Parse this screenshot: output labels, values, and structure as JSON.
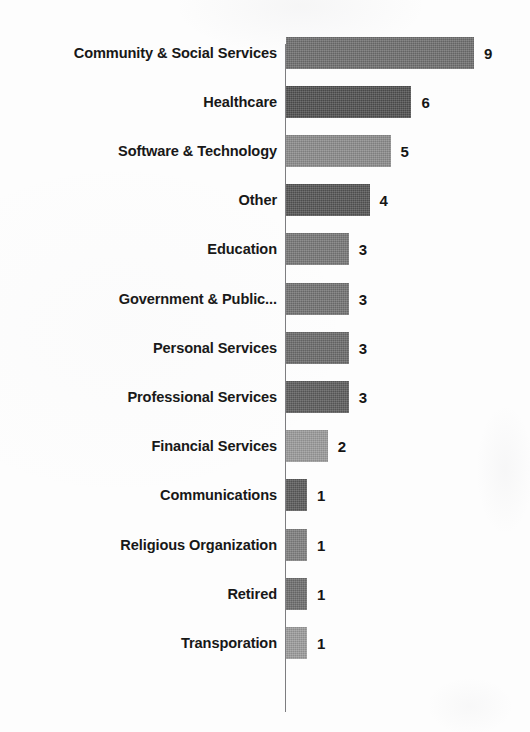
{
  "chart_data": {
    "type": "bar",
    "orientation": "horizontal",
    "title": "",
    "subtitle": "",
    "xlabel": "",
    "ylabel": "",
    "xlim": [
      0,
      9
    ],
    "grid": false,
    "legend": null,
    "data_labels_shown": true,
    "categories": [
      "Community & Social Services",
      "Healthcare",
      "Software & Technology",
      "Other",
      "Education",
      "Government & Public...",
      "Personal Services",
      "Professional Services",
      "Financial Services",
      "Communications",
      "Religious Organization",
      "Retired",
      "Transporation"
    ],
    "values": [
      9,
      6,
      5,
      4,
      3,
      3,
      3,
      3,
      2,
      1,
      1,
      1,
      1
    ],
    "bar_colors": [
      "#6e6e6e",
      "#4f4f4f",
      "#8b8b8b",
      "#545454",
      "#777777",
      "#727272",
      "#6a6a6a",
      "#5c5c5c",
      "#9a9a9a",
      "#5a5a5a",
      "#7e7e7e",
      "#6d6d6d",
      "#9b9b9b"
    ]
  },
  "axis": {
    "axis_line_color": "#7d7d80"
  },
  "page": {
    "background": "#fdfdfd",
    "text_color": "#181818"
  }
}
